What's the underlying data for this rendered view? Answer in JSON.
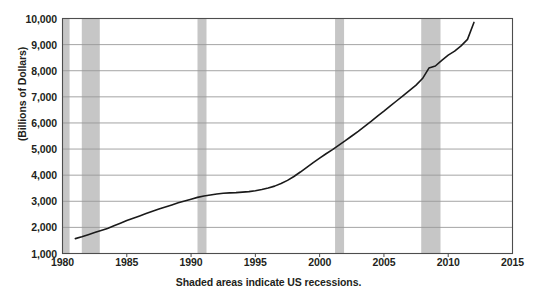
{
  "chart_data": {
    "type": "line",
    "title": "",
    "xlabel": "",
    "ylabel": "(Billions of Dollars)",
    "caption": "Shaded areas indicate US recessions.",
    "xlim": [
      1980,
      2015
    ],
    "ylim": [
      1000,
      10000
    ],
    "grid": true,
    "legend": "none",
    "xticks": [
      1980,
      1985,
      1990,
      1995,
      2000,
      2005,
      2010,
      2015
    ],
    "xtick_labels": [
      "1980",
      "1985",
      "1990",
      "1995",
      "2000",
      "2005",
      "2010",
      "2015"
    ],
    "yticks": [
      1000,
      2000,
      3000,
      4000,
      5000,
      6000,
      7000,
      8000,
      9000,
      10000
    ],
    "ytick_labels": [
      "1,000",
      "2,000",
      "3,000",
      "4,000",
      "5,000",
      "6,000",
      "7,000",
      "8,000",
      "9,000",
      "10,000"
    ],
    "line_color": "#1a1a1a",
    "shade_color": "#c6c6c6",
    "grid_color": "#9a9a9a",
    "axis_color": "#4d4d4d",
    "recessions": [
      {
        "label": "1980 recession",
        "start": 1980.0,
        "end": 1980.55
      },
      {
        "label": "1981-82 recession",
        "start": 1981.5,
        "end": 1982.9
      },
      {
        "label": "1990-91 recession",
        "start": 1990.5,
        "end": 1991.2
      },
      {
        "label": "2001 recession",
        "start": 2001.2,
        "end": 2001.9
      },
      {
        "label": "2007-09 recession",
        "start": 2007.9,
        "end": 2009.4
      }
    ],
    "x": [
      1981.0,
      1981.5,
      1982.0,
      1982.5,
      1983.0,
      1983.5,
      1984.0,
      1984.5,
      1985.0,
      1985.5,
      1986.0,
      1986.5,
      1987.0,
      1987.5,
      1988.0,
      1988.5,
      1989.0,
      1989.5,
      1990.0,
      1990.5,
      1991.0,
      1991.5,
      1992.0,
      1992.5,
      1993.0,
      1993.5,
      1994.0,
      1994.5,
      1995.0,
      1995.5,
      1996.0,
      1996.5,
      1997.0,
      1997.5,
      1998.0,
      1998.5,
      1999.0,
      1999.5,
      2000.0,
      2000.5,
      2001.0,
      2001.5,
      2002.0,
      2002.5,
      2003.0,
      2003.5,
      2004.0,
      2004.5,
      2005.0,
      2005.5,
      2006.0,
      2006.5,
      2007.0,
      2007.5,
      2008.0,
      2008.5,
      2009.0,
      2009.5,
      2010.0,
      2010.5,
      2011.0,
      2011.5,
      2012.0
    ],
    "y": [
      1570,
      1640,
      1720,
      1800,
      1880,
      1960,
      2060,
      2160,
      2260,
      2350,
      2440,
      2530,
      2620,
      2700,
      2780,
      2860,
      2940,
      3010,
      3080,
      3150,
      3200,
      3240,
      3280,
      3310,
      3320,
      3330,
      3350,
      3370,
      3400,
      3450,
      3510,
      3580,
      3680,
      3800,
      3950,
      4120,
      4300,
      4480,
      4650,
      4820,
      4980,
      5150,
      5320,
      5500,
      5680,
      5870,
      6060,
      6260,
      6450,
      6650,
      6850,
      7050,
      7250,
      7450,
      7700,
      8100,
      8180,
      8400,
      8600,
      8750,
      8950,
      9200,
      9850
    ]
  }
}
